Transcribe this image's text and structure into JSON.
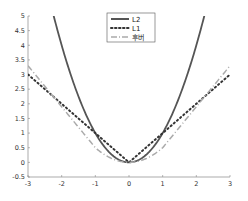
{
  "chart_data": {
    "type": "line",
    "title": "",
    "xlabel": "",
    "ylabel": "",
    "xlim": [
      -3,
      3
    ],
    "ylim": [
      -0.5,
      5
    ],
    "grid": false,
    "legend_position": "top-center",
    "x_ticks": [
      "-3",
      "-2",
      "-1",
      "0",
      "1",
      "2",
      "3"
    ],
    "y_ticks": [
      "-0.5",
      "0",
      "0.5",
      "1",
      "1.5",
      "2",
      "2.5",
      "3",
      "3.5",
      "4",
      "4.5",
      "5"
    ],
    "x": [
      -3,
      -2.5,
      -2,
      -1.5,
      -1,
      -0.5,
      0,
      0.5,
      1,
      1.5,
      2,
      2.5,
      3
    ],
    "series": [
      {
        "name": "L2",
        "style": "solid",
        "color": "#555555",
        "values": [
          9,
          6.25,
          4,
          2.25,
          1,
          0.25,
          0,
          0.25,
          1,
          2.25,
          4,
          6.25,
          9
        ]
      },
      {
        "name": "L1",
        "style": "dotted",
        "color": "#333333",
        "values": [
          3,
          2.5,
          2,
          1.5,
          1,
          0.5,
          0,
          0.5,
          1,
          1.5,
          2,
          2.5,
          3
        ]
      },
      {
        "name": "후버",
        "style": "dash-dot",
        "color": "#aaaaaa",
        "values": [
          3.3,
          2.6,
          1.9,
          1.2,
          0.5,
          0.125,
          0,
          0.125,
          0.5,
          1.2,
          1.9,
          2.6,
          3.3
        ]
      }
    ]
  },
  "legend": {
    "items": [
      {
        "label": "L2"
      },
      {
        "label": "L1"
      },
      {
        "label": "후버"
      }
    ]
  }
}
